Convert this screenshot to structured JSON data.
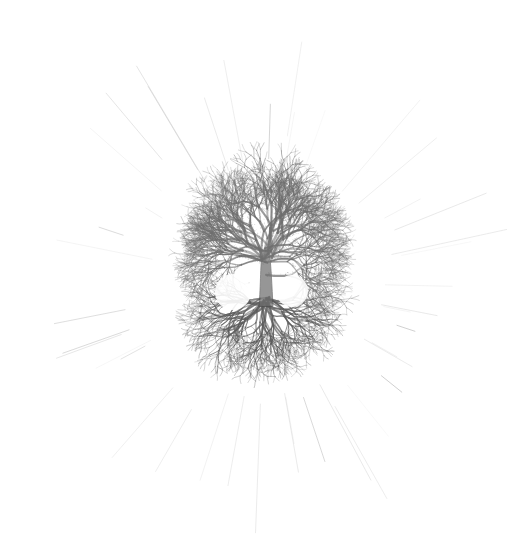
{
  "artwork": {
    "title": "Tree of Life",
    "medium": "graphite pencil drawing",
    "subject": "radial fractal tree mandala with canopy, roots and sunburst rays",
    "background_color": "#ffffff",
    "canvas": {
      "width": 511,
      "height": 559
    }
  },
  "palette": {
    "paper": "#ffffff",
    "graphite_dark": "#4a4a4a",
    "graphite_mid": "#6f6f6f",
    "graphite_light": "#9a9a9a",
    "ray_faint": "#b9b9b9",
    "ray_very_faint": "#d6d6d6"
  },
  "composition": {
    "center_x": 265,
    "center_y": 282,
    "disc_radius": 103,
    "canopy_top_y": 176,
    "roots_bottom_y": 386,
    "disc_left_x": 163,
    "disc_right_x": 367,
    "trunk_x": 265,
    "trunk_top_y": 250,
    "trunk_base_y": 300
  },
  "tree": {
    "canopy": {
      "label": "canopy",
      "branch_count": 22,
      "depth": 7,
      "spread_degrees": 200,
      "stroke_color": "#6f6f6f",
      "texture": "bumpy stippled twigs"
    },
    "roots": {
      "label": "root system",
      "branch_count": 20,
      "depth": 6,
      "spread_degrees": 170,
      "stroke_color": "#5c5c5c",
      "texture": "wispy tapering filaments"
    },
    "voids": [
      {
        "name": "left-void",
        "cx": 233,
        "cy": 292,
        "r": 18
      },
      {
        "name": "right-void",
        "cx": 292,
        "cy": 291,
        "r": 16
      }
    ]
  },
  "rays": {
    "label": "sunburst rays",
    "count": 36,
    "origin_x": 265,
    "origin_y": 282,
    "inner_radius": 112,
    "outer_radius_min": 130,
    "outer_radius_max": 255,
    "color": "#bcbcbc",
    "style": "faint straight pencil strokes"
  }
}
